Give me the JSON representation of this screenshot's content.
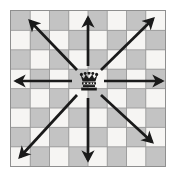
{
  "figure": {
    "name": "chess-queen-movement-diagram",
    "piece": "queen",
    "piece_glyph": "black-queen",
    "board_size": 8,
    "board_colors": {
      "light_square": "#f6f5f3",
      "dark_square": "#c3c3c3",
      "grid_line": "#9a9a9a",
      "border": "#8f8f8f",
      "arrow": "#1a1a1a",
      "background": "#ffffff"
    },
    "piece_square": {
      "col": 4,
      "row": 4
    },
    "board_pattern_start": "dark",
    "arrow_count": 8
  },
  "chart_data": {
    "type": "diagram",
    "title": "",
    "subtitle": "",
    "xlabel": "",
    "ylabel": "",
    "grid": true,
    "legend": null,
    "board": {
      "rows": 8,
      "cols": 8,
      "top_left_square": "dark",
      "squares": [
        [
          "dark",
          "light",
          "dark",
          "light",
          "dark",
          "light",
          "dark",
          "light"
        ],
        [
          "light",
          "dark",
          "light",
          "dark",
          "light",
          "dark",
          "light",
          "dark"
        ],
        [
          "dark",
          "light",
          "dark",
          "light",
          "dark",
          "light",
          "dark",
          "light"
        ],
        [
          "light",
          "dark",
          "light",
          "dark",
          "light",
          "dark",
          "light",
          "dark"
        ],
        [
          "dark",
          "light",
          "dark",
          "light",
          "dark",
          "light",
          "dark",
          "light"
        ],
        [
          "light",
          "dark",
          "light",
          "dark",
          "light",
          "dark",
          "light",
          "dark"
        ],
        [
          "dark",
          "light",
          "dark",
          "light",
          "dark",
          "light",
          "dark",
          "light"
        ],
        [
          "light",
          "dark",
          "light",
          "dark",
          "light",
          "dark",
          "light",
          "dark"
        ]
      ]
    },
    "piece": {
      "type": "queen",
      "color": "black",
      "position_col": 4,
      "position_row": 4
    },
    "arrows": [
      {
        "name": "up",
        "direction": "N",
        "x1": 88,
        "y1": 66,
        "x2": 88,
        "y2": 18
      },
      {
        "name": "down",
        "direction": "S",
        "x1": 88,
        "y1": 98,
        "x2": 88,
        "y2": 160
      },
      {
        "name": "left",
        "direction": "W",
        "x1": 72,
        "y1": 81,
        "x2": 16,
        "y2": 81
      },
      {
        "name": "right",
        "direction": "E",
        "x1": 104,
        "y1": 81,
        "x2": 162,
        "y2": 81
      },
      {
        "name": "up-left",
        "direction": "NW",
        "x1": 77,
        "y1": 70,
        "x2": 30,
        "y2": 21
      },
      {
        "name": "up-right",
        "direction": "NE",
        "x1": 101,
        "y1": 70,
        "x2": 153,
        "y2": 19
      },
      {
        "name": "down-left",
        "direction": "SW",
        "x1": 77,
        "y1": 95,
        "x2": 20,
        "y2": 157
      },
      {
        "name": "down-right",
        "direction": "SE",
        "x1": 101,
        "y1": 95,
        "x2": 152,
        "y2": 142
      }
    ]
  }
}
